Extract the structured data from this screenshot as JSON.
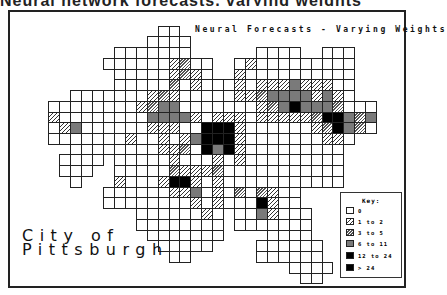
{
  "caption_fragment": "Neural network forecasts, varying weights",
  "map": {
    "title": "Neural Forecasts - Varying Weights",
    "city_label": [
      "City of",
      "Pittsburgh"
    ]
  },
  "legend": {
    "title": "Key:",
    "items": [
      {
        "label": "0",
        "class": 0
      },
      {
        "label": "1 to 2",
        "class": 1
      },
      {
        "label": "3 to 5",
        "class": 2
      },
      {
        "label": "6 to 11",
        "class": 3
      },
      {
        "label": "12 to 24",
        "class": 4
      },
      {
        "label": "> 24",
        "class": 5
      }
    ]
  },
  "colors": {
    "outline": "#222222",
    "class_3_gray": "#7a7a7a",
    "class_4_black": "#000000",
    "class_5_black": "#000000"
  },
  "chart_data": {
    "type": "heatmap",
    "title": "Neural Forecasts - Varying Weights",
    "subtitle": "City of Pittsburgh",
    "legend_position": "lower-right",
    "legend": [
      "0",
      "1 to 2",
      "3 to 5",
      "6 to 11",
      "12 to 24",
      "> 24"
    ],
    "grid": {
      "origin_x": 48.3,
      "origin_y": 25.6,
      "cell_w": 10.93,
      "cell_h": 10.74
    },
    "rows": [
      {
        "r": 0,
        "spans": [
          [
            10,
            11
          ]
        ],
        "cells": {}
      },
      {
        "r": 1,
        "spans": [
          [
            9,
            12
          ]
        ],
        "cells": {}
      },
      {
        "r": 2,
        "spans": [
          [
            6,
            12
          ],
          [
            19,
            22
          ],
          [
            25,
            27
          ]
        ],
        "cells": {}
      },
      {
        "r": 3,
        "spans": [
          [
            5,
            14
          ],
          [
            17,
            27
          ]
        ],
        "cells": {
          "11": 1,
          "12": 2,
          "18": 1
        }
      },
      {
        "r": 4,
        "spans": [
          [
            6,
            14
          ],
          [
            17,
            27
          ]
        ],
        "cells": {
          "11": 1,
          "12": 2,
          "13": 1,
          "17": 1
        }
      },
      {
        "r": 5,
        "spans": [
          [
            6,
            27
          ]
        ],
        "cells": {
          "11": 2,
          "13": 1,
          "17": 1,
          "19": 1,
          "20": 1,
          "21": 1,
          "22": 3,
          "23": 1,
          "24": 1,
          "25": 1
        }
      },
      {
        "r": 6,
        "spans": [
          [
            2,
            27
          ]
        ],
        "cells": {
          "9": 1,
          "10": 2,
          "11": 1,
          "17": 1,
          "18": 1,
          "19": 2,
          "20": 3,
          "21": 3,
          "22": 3,
          "23": 3,
          "24": 1,
          "25": 3,
          "26": 1
        }
      },
      {
        "r": 7,
        "spans": [
          [
            0,
            29
          ]
        ],
        "cells": {
          "8": 1,
          "9": 2,
          "10": 3,
          "11": 3,
          "19": 1,
          "20": 2,
          "21": 3,
          "22": 4,
          "23": 3,
          "24": 3,
          "25": 3,
          "26": 2
        }
      },
      {
        "r": 8,
        "spans": [
          [
            0,
            29
          ]
        ],
        "cells": {
          "0": 1,
          "9": 3,
          "10": 3,
          "11": 3,
          "12": 3,
          "13": 1,
          "15": 1,
          "16": 1,
          "17": 1,
          "19": 1,
          "20": 1,
          "21": 1,
          "22": 1,
          "23": 1,
          "24": 2,
          "25": 5,
          "26": 5,
          "27": 3,
          "28": 2,
          "29": 3
        }
      },
      {
        "r": 9,
        "spans": [
          [
            0,
            29
          ]
        ],
        "cells": {
          "1": 1,
          "2": 3,
          "9": 1,
          "10": 1,
          "11": 1,
          "14": 5,
          "15": 5,
          "16": 5,
          "17": 1,
          "24": 1,
          "25": 2,
          "26": 5,
          "27": 3,
          "28": 2
        }
      },
      {
        "r": 10,
        "spans": [
          [
            0,
            27
          ]
        ],
        "cells": {
          "7": 1,
          "10": 1,
          "12": 1,
          "13": 3,
          "14": 5,
          "15": 5,
          "16": 5,
          "17": 1,
          "25": 1,
          "26": 1
        }
      },
      {
        "r": 11,
        "spans": [
          [
            2,
            26
          ]
        ],
        "cells": {
          "10": 1,
          "11": 1,
          "12": 2,
          "14": 4,
          "15": 3,
          "16": 4,
          "17": 1
        }
      },
      {
        "r": 12,
        "spans": [
          [
            1,
            4
          ],
          [
            6,
            26
          ]
        ],
        "cells": {
          "11": 1,
          "15": 1,
          "17": 1
        }
      },
      {
        "r": 13,
        "spans": [
          [
            1,
            3
          ],
          [
            6,
            26
          ]
        ],
        "cells": {
          "11": 2,
          "12": 1,
          "13": 1,
          "14": 1,
          "15": 2
        }
      },
      {
        "r": 14,
        "spans": [
          [
            2,
            2
          ],
          [
            6,
            26
          ]
        ],
        "cells": {
          "6": 1,
          "10": 1,
          "11": 4,
          "12": 4,
          "13": 1,
          "15": 1
        }
      },
      {
        "r": 15,
        "spans": [
          [
            5,
            22
          ]
        ],
        "cells": {
          "11": 1,
          "12": 1,
          "13": 3,
          "15": 1,
          "17": 2,
          "19": 2,
          "20": 1
        }
      },
      {
        "r": 16,
        "spans": [
          [
            5,
            22
          ]
        ],
        "cells": {
          "13": 1,
          "15": 1,
          "19": 4,
          "20": 1
        }
      },
      {
        "r": 17,
        "spans": [
          [
            8,
            15
          ],
          [
            17,
            23
          ]
        ],
        "cells": {
          "14": 1,
          "19": 3,
          "20": 1
        }
      },
      {
        "r": 18,
        "spans": [
          [
            8,
            15
          ],
          [
            17,
            23
          ]
        ],
        "cells": {}
      },
      {
        "r": 19,
        "spans": [
          [
            9,
            15
          ],
          [
            20,
            23
          ]
        ],
        "cells": {}
      },
      {
        "r": 20,
        "spans": [
          [
            10,
            14
          ],
          [
            19,
            24
          ]
        ],
        "cells": {}
      },
      {
        "r": 21,
        "spans": [
          [
            11,
            12
          ],
          [
            19,
            24
          ]
        ],
        "cells": {}
      },
      {
        "r": 22,
        "spans": [
          [
            22,
            25
          ]
        ],
        "cells": {}
      },
      {
        "r": 23,
        "spans": [
          [
            23,
            24
          ]
        ],
        "cells": {}
      }
    ]
  }
}
